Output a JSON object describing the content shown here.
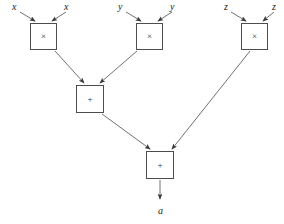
{
  "diagram": {
    "type": "computation-graph",
    "title": "",
    "background_color": "#ffffff",
    "edge_color": "#4d4d4d",
    "node_border_color": "#4d4d4d",
    "node_text_color": "#2b2b2b",
    "label_color": "#1a1a1a",
    "nodes": [
      {
        "id": "mul_x",
        "op": "×",
        "x": 30,
        "y": 23,
        "w": 27,
        "h": 27
      },
      {
        "id": "mul_y",
        "op": "×",
        "x": 136,
        "y": 23,
        "w": 27,
        "h": 27
      },
      {
        "id": "mul_z",
        "op": "×",
        "x": 241,
        "y": 23,
        "w": 27,
        "h": 27
      },
      {
        "id": "add_mid",
        "op": "+",
        "x": 76,
        "y": 85,
        "w": 28,
        "h": 28
      },
      {
        "id": "add_out",
        "op": "+",
        "x": 146,
        "y": 151,
        "w": 28,
        "h": 28
      }
    ],
    "inputs": [
      {
        "id": "x_left",
        "label": "x",
        "x": 12,
        "y": 2
      },
      {
        "id": "x_right",
        "label": "x",
        "x": 64,
        "y": 2
      },
      {
        "id": "y_left",
        "label": "y",
        "x": 118,
        "y": 2
      },
      {
        "id": "y_right",
        "label": "y",
        "x": 170,
        "y": 2
      },
      {
        "id": "z_left",
        "label": "z",
        "x": 224,
        "y": 2
      },
      {
        "id": "z_right",
        "label": "z",
        "x": 272,
        "y": 2
      }
    ],
    "output": {
      "id": "result",
      "label": "a",
      "x": 158,
      "y": 206
    },
    "edges": [
      {
        "from": "x_left",
        "to": "mul_x",
        "x1": 20,
        "y1": 12,
        "x2": 35,
        "y2": 21
      },
      {
        "from": "x_right",
        "to": "mul_x",
        "x1": 66,
        "y1": 12,
        "x2": 52,
        "y2": 21
      },
      {
        "from": "y_left",
        "to": "mul_y",
        "x1": 126,
        "y1": 12,
        "x2": 141,
        "y2": 21
      },
      {
        "from": "y_right",
        "to": "mul_y",
        "x1": 172,
        "y1": 12,
        "x2": 158,
        "y2": 21
      },
      {
        "from": "z_left",
        "to": "mul_z",
        "x1": 231,
        "y1": 12,
        "x2": 246,
        "y2": 21
      },
      {
        "from": "z_right",
        "to": "mul_z",
        "x1": 274,
        "y1": 12,
        "x2": 263,
        "y2": 21
      },
      {
        "from": "mul_x",
        "to": "add_mid",
        "x1": 55,
        "y1": 51,
        "x2": 84,
        "y2": 83
      },
      {
        "from": "mul_y",
        "to": "add_mid",
        "x1": 137,
        "y1": 51,
        "x2": 100,
        "y2": 83
      },
      {
        "from": "add_mid",
        "to": "add_out",
        "x1": 102,
        "y1": 114,
        "x2": 150,
        "y2": 149
      },
      {
        "from": "mul_z",
        "to": "add_out",
        "x1": 250,
        "y1": 51,
        "x2": 172,
        "y2": 149
      },
      {
        "from": "add_out",
        "to": "result",
        "x1": 160,
        "y1": 180,
        "x2": 160,
        "y2": 199
      }
    ]
  }
}
